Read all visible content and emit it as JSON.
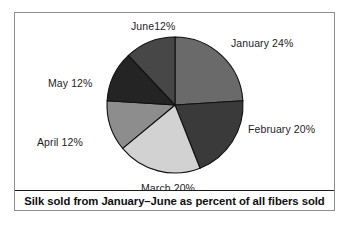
{
  "figure": {
    "caption": "Silk sold from January–June as percent of all fibers sold",
    "border_color": "#8e8e8e",
    "background": "#ffffff"
  },
  "labels": {
    "january": "January 24%",
    "february": "February 20%",
    "march": "March 20%",
    "april": "April 12%",
    "may": "May 12%",
    "june": "June12%"
  },
  "chart_data": {
    "type": "pie",
    "title": "Silk sold from January–June as percent of all fibers sold",
    "xlabel": "",
    "ylabel": "",
    "units": "percent",
    "start_angle_deg": 0,
    "direction": "clockwise",
    "grid": false,
    "legend": "none",
    "labels_position": "outside",
    "center_px": [
      175,
      105
    ],
    "radius_px": 68,
    "categories": [
      "January",
      "February",
      "March",
      "April",
      "May",
      "June"
    ],
    "values": [
      24,
      20,
      20,
      12,
      12,
      12
    ],
    "value_labels": [
      "24%",
      "20%",
      "20%",
      "12%",
      "12%",
      "12%"
    ],
    "total": 100,
    "slice_angles_deg": [
      86.4,
      72,
      72,
      43.2,
      43.2,
      43.2
    ],
    "colors": [
      "#6a6a6a",
      "#3a3a3a",
      "#d2d2d2",
      "#8d8d8d",
      "#242424",
      "#474747"
    ],
    "slice_outline_color": "#111111",
    "series": [
      {
        "name": "Percent of all fibers sold",
        "values": [
          24,
          20,
          20,
          12,
          12,
          12
        ]
      }
    ]
  }
}
